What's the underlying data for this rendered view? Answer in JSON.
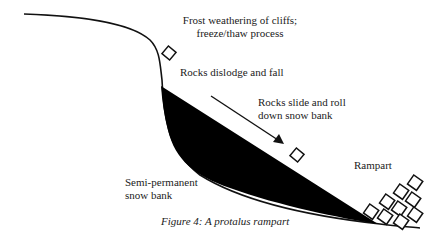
{
  "diagram": {
    "title": "A protalus rampart",
    "labels": {
      "frost": [
        "Frost weathering of cliffs;",
        "freeze/thaw process"
      ],
      "dislodge": "Rocks dislodge and fall",
      "slide": [
        "Rocks slide and roll",
        "down snow bank"
      ],
      "snowbank": [
        "Semi-permanent",
        "snow bank"
      ],
      "rampart": "Rampart"
    },
    "caption": "Figure 4: A protalus rampart",
    "colors": {
      "line": "#111111",
      "snowbank_fill": "#000000",
      "background": "#ffffff"
    }
  }
}
